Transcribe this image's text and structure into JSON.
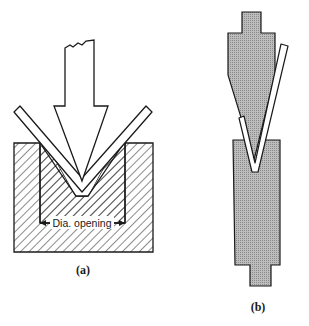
{
  "diagram": {
    "panels": [
      {
        "id": "a",
        "label": "(a)",
        "description": "Air bending punch pressing sheet into V-die",
        "dimension_label": "Dia. opening"
      },
      {
        "id": "b",
        "label": "(b)",
        "description": "Press brake upper punch and lower V-die with bent sheet"
      }
    ],
    "colors": {
      "line": "#1a1a1a",
      "tool_fill": "#b0b0b0",
      "background": "#ffffff"
    }
  }
}
